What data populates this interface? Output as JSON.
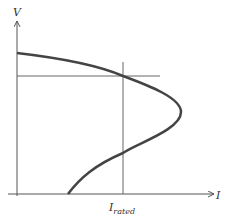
{
  "diagram": {
    "type": "V-I characteristic curve",
    "axes": {
      "y_label": "V",
      "x_label": "I"
    },
    "marker": {
      "x_label_main": "I",
      "x_label_sub": "rated"
    },
    "colors": {
      "curve": "#444444",
      "axis": "#555555",
      "guide": "#666666",
      "text": "#333333"
    }
  }
}
